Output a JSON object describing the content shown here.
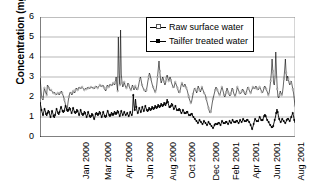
{
  "chart_data": {
    "type": "line",
    "title": "",
    "xlabel": "",
    "ylabel": "Concentration (mg/l)",
    "ylim": [
      0,
      6
    ],
    "yticks": [
      0,
      1,
      2,
      3,
      4,
      5,
      6
    ],
    "grid": true,
    "legend_position": "top-center",
    "xtick_labels": [
      "Jan 2000",
      "Mar 2000",
      "Apr 2000",
      "Jun 2000",
      "Aug 2000",
      "Oct 2000",
      "Dec 2000",
      "Feb 2001",
      "Apr 2001",
      "Jun 2001",
      "Aug 2001",
      "Oct 2001",
      "Dec 2001"
    ],
    "series": [
      {
        "name": "Raw surface water",
        "color": "#000000",
        "marker": "open-circle",
        "values": [
          3.0,
          2.55,
          2.1,
          1.95,
          1.85,
          2.2,
          2.45,
          2.3,
          2.2,
          2.1,
          2.6,
          2.55,
          2.45,
          2.35,
          2.3,
          2.35,
          2.3,
          2.25,
          2.2,
          2.25,
          2.2,
          2.15,
          2.1,
          2.15,
          2.2,
          2.15,
          2.1,
          2.2,
          2.25,
          2.3,
          2.2,
          2.1,
          2.0,
          1.85,
          1.7,
          1.5,
          1.35,
          1.45,
          1.75,
          2.0,
          2.15,
          2.25,
          2.2,
          2.1,
          2.15,
          2.3,
          2.25,
          2.2,
          2.35,
          2.45,
          2.4,
          2.35,
          2.45,
          2.5,
          2.45,
          2.4,
          2.45,
          2.5,
          2.45,
          2.4,
          2.35,
          2.4,
          2.45,
          2.4,
          2.45,
          2.5,
          2.45,
          2.4,
          2.45,
          2.5,
          2.45,
          2.5,
          2.45,
          2.4,
          2.45,
          2.5,
          2.55,
          2.5,
          2.45,
          2.5,
          2.55,
          2.6,
          2.55,
          2.5,
          2.55,
          2.6,
          2.55,
          2.45,
          2.35,
          2.3,
          2.45,
          2.6,
          2.55,
          2.5,
          2.6,
          2.65,
          2.6,
          2.55,
          2.6,
          2.7,
          2.65,
          2.6,
          2.75,
          3.0,
          2.6,
          2.3,
          5.0,
          3.2,
          2.6,
          5.35,
          3.15,
          2.7,
          2.5,
          2.6,
          2.75,
          2.6,
          2.5,
          2.45,
          2.55,
          2.7,
          2.6,
          2.5,
          2.4,
          2.35,
          2.45,
          2.6,
          2.5,
          2.35,
          2.4,
          2.55,
          2.45,
          2.35,
          2.4,
          2.5,
          2.7,
          2.9,
          3.0,
          2.8,
          2.6,
          2.5,
          2.4,
          2.35,
          2.3,
          2.25,
          2.35,
          2.55,
          2.8,
          3.0,
          3.2,
          3.1,
          2.9,
          2.75,
          2.6,
          2.5,
          2.4,
          2.3,
          2.25,
          2.35,
          2.6,
          3.0,
          3.4,
          3.8,
          3.3,
          2.9,
          2.7,
          2.85,
          3.0,
          2.9,
          2.75,
          2.6,
          2.7,
          2.95,
          3.1,
          2.95,
          2.8,
          2.9,
          3.0,
          2.85,
          2.7,
          2.6,
          2.5,
          2.45,
          2.6,
          2.75,
          2.65,
          2.55,
          2.45,
          2.3,
          2.2,
          2.25,
          2.4,
          2.6,
          2.7,
          2.6,
          2.5,
          2.55,
          2.65,
          2.55,
          2.45,
          2.35,
          2.2,
          2.05,
          1.9,
          1.8,
          1.7,
          1.75,
          1.95,
          2.15,
          2.3,
          2.45,
          2.4,
          2.3,
          2.2,
          2.35,
          2.55,
          2.45,
          2.35,
          2.25,
          2.35,
          2.5,
          2.4,
          2.3,
          2.2,
          2.15,
          2.05,
          1.9,
          1.75,
          1.6,
          1.45,
          1.3,
          1.2,
          1.25,
          1.45,
          1.7,
          1.9,
          2.05,
          2.2,
          2.35,
          2.5,
          2.45,
          2.35,
          2.25,
          2.15,
          2.1,
          2.2,
          2.35,
          2.5,
          2.4,
          2.25,
          2.1,
          2.0,
          2.1,
          2.25,
          2.45,
          2.35,
          2.2,
          2.1,
          2.05,
          2.15,
          2.3,
          2.45,
          2.35,
          2.2,
          2.1,
          2.05,
          2.15,
          2.3,
          2.5,
          2.4,
          2.3,
          2.2,
          2.15,
          2.2,
          2.3,
          2.4,
          2.35,
          2.25,
          2.15,
          2.1,
          2.2,
          2.35,
          2.5,
          2.45,
          2.35,
          2.25,
          2.2,
          2.3,
          2.4,
          2.5,
          2.45,
          2.4,
          2.45,
          2.55,
          2.5,
          2.4,
          2.35,
          2.4,
          2.5,
          2.45,
          2.35,
          2.25,
          2.2,
          2.3,
          2.45,
          2.55,
          2.5,
          2.4,
          2.3,
          2.2,
          2.1,
          2.2,
          2.45,
          2.8,
          3.2,
          3.9,
          3.3,
          2.7,
          2.6,
          3.0,
          4.25,
          3.2,
          2.4,
          2.0,
          1.95,
          2.1,
          2.3,
          2.2,
          2.1,
          2.2,
          2.5,
          2.9,
          3.35,
          3.9,
          3.2,
          2.8,
          3.05,
          2.9,
          2.7,
          2.6,
          2.75,
          2.8,
          2.6,
          2.4,
          2.2,
          1.9,
          1.55
        ],
        "notable_peaks": [
          5.0,
          5.35,
          3.8,
          4.25,
          3.9
        ]
      },
      {
        "name": "Tailfer treated water",
        "color": "#000000",
        "marker": "filled-diamond",
        "values": [
          1.7,
          1.55,
          1.35,
          1.2,
          1.1,
          1.25,
          1.4,
          1.3,
          1.15,
          1.05,
          1.2,
          1.35,
          1.25,
          1.1,
          1.0,
          1.15,
          1.3,
          1.2,
          1.05,
          0.95,
          1.1,
          1.25,
          1.4,
          1.3,
          1.2,
          1.1,
          1.25,
          1.4,
          1.5,
          1.4,
          1.3,
          1.2,
          1.3,
          1.45,
          1.55,
          1.45,
          1.35,
          1.25,
          1.35,
          1.5,
          1.4,
          1.3,
          1.2,
          1.3,
          1.45,
          1.35,
          1.25,
          1.15,
          1.25,
          1.4,
          1.3,
          1.2,
          1.1,
          1.2,
          1.35,
          1.25,
          1.15,
          1.05,
          1.15,
          1.3,
          1.2,
          1.1,
          1.0,
          1.1,
          1.25,
          1.15,
          1.05,
          0.95,
          1.05,
          1.2,
          1.1,
          1.0,
          0.9,
          1.0,
          1.15,
          1.25,
          1.15,
          1.05,
          1.15,
          1.3,
          1.2,
          1.1,
          1.0,
          1.1,
          1.25,
          1.15,
          1.05,
          0.95,
          1.05,
          1.2,
          1.3,
          1.2,
          1.1,
          1.0,
          1.1,
          1.25,
          1.15,
          1.05,
          1.15,
          1.3,
          1.2,
          1.1,
          1.2,
          1.35,
          1.25,
          1.15,
          1.05,
          1.15,
          1.3,
          1.2,
          1.1,
          1.15,
          1.25,
          1.15,
          1.1,
          1.15,
          1.2,
          1.1,
          1.05,
          1.15,
          1.25,
          1.15,
          1.1,
          1.2,
          2.1,
          1.6,
          1.35,
          1.9,
          1.5,
          1.3,
          1.2,
          1.3,
          1.45,
          1.35,
          1.25,
          1.35,
          1.5,
          1.4,
          1.3,
          1.4,
          1.55,
          1.45,
          1.35,
          1.25,
          1.35,
          1.5,
          1.4,
          1.3,
          1.4,
          1.55,
          1.45,
          1.35,
          1.45,
          1.6,
          1.5,
          1.4,
          1.5,
          1.65,
          1.55,
          1.45,
          1.55,
          1.7,
          1.6,
          1.5,
          1.6,
          1.75,
          1.65,
          1.55,
          1.7,
          1.9,
          1.75,
          1.6,
          1.5,
          1.45,
          1.55,
          1.7,
          1.6,
          1.5,
          1.4,
          1.45,
          1.55,
          1.45,
          1.35,
          1.3,
          1.35,
          1.45,
          1.35,
          1.25,
          1.2,
          1.25,
          1.35,
          1.3,
          1.2,
          1.15,
          1.2,
          1.3,
          1.25,
          1.15,
          1.1,
          1.05,
          1.1,
          1.2,
          1.15,
          1.05,
          1.0,
          0.95,
          0.9,
          0.85,
          0.8,
          0.75,
          0.7,
          0.75,
          0.85,
          0.8,
          0.75,
          0.7,
          0.65,
          0.7,
          0.8,
          0.75,
          0.7,
          0.65,
          0.6,
          0.65,
          0.75,
          0.7,
          0.65,
          0.6,
          0.55,
          0.5,
          0.45,
          0.5,
          0.6,
          0.7,
          0.65,
          0.6,
          0.65,
          0.75,
          0.7,
          0.65,
          0.6,
          0.7,
          0.8,
          0.75,
          0.7,
          0.65,
          0.7,
          0.8,
          0.75,
          0.7,
          0.65,
          0.7,
          0.8,
          0.75,
          0.7,
          0.75,
          0.85,
          0.8,
          0.75,
          0.7,
          0.75,
          0.85,
          0.8,
          0.75,
          0.7,
          0.75,
          0.85,
          0.8,
          0.75,
          0.8,
          0.9,
          0.85,
          0.8,
          0.75,
          0.8,
          0.9,
          0.85,
          0.8,
          0.75,
          0.7,
          0.6,
          0.5,
          0.4,
          0.5,
          0.65,
          0.8,
          0.9,
          0.85,
          0.8,
          0.75,
          0.8,
          0.9,
          1.0,
          0.95,
          0.85,
          0.8,
          0.85,
          0.95,
          1.05,
          1.15,
          1.05,
          0.95,
          0.85,
          0.8,
          0.75,
          0.65,
          0.6,
          0.55,
          0.5,
          0.45,
          0.55,
          0.7,
          0.85,
          1.0,
          1.2,
          1.4,
          1.25,
          1.05,
          0.9,
          0.8,
          0.75,
          0.8,
          0.9,
          0.85,
          0.8,
          0.75,
          0.7,
          0.75,
          0.85,
          0.95,
          0.9,
          0.85,
          0.8,
          0.9,
          1.0,
          1.1,
          1.2,
          1.05,
          0.85,
          0.7
        ],
        "notable_peaks": [
          2.1,
          1.9,
          1.4
        ]
      }
    ]
  }
}
